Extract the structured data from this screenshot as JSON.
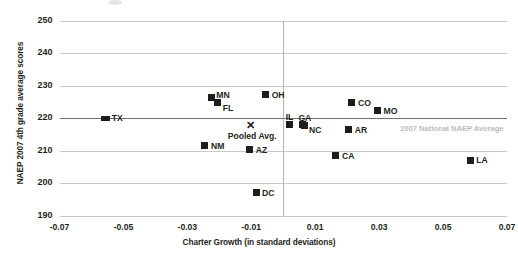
{
  "chart_data": {
    "type": "scatter",
    "title": "",
    "xlabel": "Charter Growth (in standard deviations)",
    "ylabel": "NAEP 2007 4th grade average scores",
    "xlim": [
      -0.07,
      0.07
    ],
    "ylim": [
      190,
      250
    ],
    "xticks": [
      "-0.07",
      "-0.05",
      "-0.03",
      "-0.01",
      "0.01",
      "0.03",
      "0.05",
      "0.07"
    ],
    "xtick_values": [
      -0.07,
      -0.05,
      -0.03,
      -0.01,
      0.01,
      0.03,
      0.05,
      0.07
    ],
    "yticks": [
      "250",
      "240",
      "230",
      "220",
      "210",
      "200",
      "190"
    ],
    "ytick_values": [
      250,
      240,
      230,
      220,
      210,
      200,
      190
    ],
    "grid": true,
    "legend": "none",
    "marker_color": "#1d1d1d",
    "gridline_color": "#c9c9c9",
    "reference_lines": [
      {
        "name": "national-average",
        "orientation": "horizontal",
        "value": 220,
        "label": "2007 National NAEP Average",
        "color": "#6e6e6e",
        "label_color": "#bcbcbc"
      },
      {
        "name": "zero-growth",
        "orientation": "vertical",
        "value": 0,
        "label": "",
        "color": "#b5b5b5"
      }
    ],
    "points": [
      {
        "label": "TX",
        "x": -0.0555,
        "y": 220.0,
        "marker": "wide",
        "label_pos": "right"
      },
      {
        "label": "MN",
        "x": -0.0225,
        "y": 226.4,
        "marker": "square",
        "label_pos": "upper-right"
      },
      {
        "label": "FL",
        "x": -0.0205,
        "y": 224.8,
        "marker": "square",
        "label_pos": "right-below"
      },
      {
        "label": "OH",
        "x": -0.0055,
        "y": 227.3,
        "marker": "square",
        "label_pos": "right"
      },
      {
        "label": "IL",
        "x": 0.002,
        "y": 218.1,
        "marker": "square",
        "label_pos": "above"
      },
      {
        "label": "GA",
        "x": 0.006,
        "y": 218.0,
        "marker": "square",
        "label_pos": "above"
      },
      {
        "label": "NC",
        "x": 0.0065,
        "y": 217.9,
        "marker": "square",
        "label_pos": "right-below"
      },
      {
        "label": "CO",
        "x": 0.0215,
        "y": 224.8,
        "marker": "square",
        "label_pos": "right"
      },
      {
        "label": "MO",
        "x": 0.0295,
        "y": 222.3,
        "marker": "square",
        "label_pos": "right"
      },
      {
        "label": "AR",
        "x": 0.0205,
        "y": 216.5,
        "marker": "square",
        "label_pos": "right"
      },
      {
        "label": "CA",
        "x": 0.0165,
        "y": 208.5,
        "marker": "square",
        "label_pos": "right"
      },
      {
        "label": "LA",
        "x": 0.0585,
        "y": 207.0,
        "marker": "square",
        "label_pos": "right"
      },
      {
        "label": "NM",
        "x": -0.0245,
        "y": 211.5,
        "marker": "square",
        "label_pos": "right"
      },
      {
        "label": "AZ",
        "x": -0.0105,
        "y": 210.3,
        "marker": "square",
        "label_pos": "right"
      },
      {
        "label": "DC",
        "x": -0.0085,
        "y": 197.0,
        "marker": "square",
        "label_pos": "right"
      },
      {
        "label": "Pooled Avg.",
        "x": -0.0105,
        "y": 217.5,
        "marker": "x",
        "label_pos": "below"
      }
    ]
  }
}
